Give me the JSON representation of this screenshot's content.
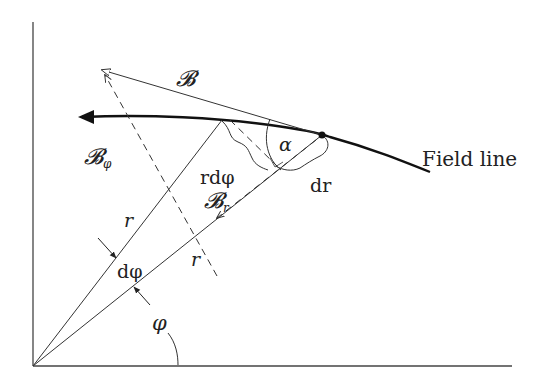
{
  "diagram": {
    "labels": {
      "B": "𝓑",
      "B_phi_main": "𝓑",
      "B_phi_sub": "φ",
      "B_r_main": "𝓑",
      "B_r_sub": "r",
      "r_dphi": "rdφ",
      "alpha": "α",
      "dr": "dr",
      "field_line": "Field line",
      "r_upper": "r",
      "r_lower": "r",
      "dphi": "dφ",
      "phi": "φ"
    },
    "colors": {
      "stroke": "#333333",
      "background": "#ffffff"
    }
  }
}
